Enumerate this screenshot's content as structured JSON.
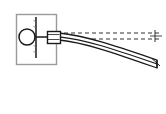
{
  "figure": {
    "canvas": {
      "width": 166,
      "height": 114,
      "background": "#ffffff"
    },
    "colors": {
      "outline": "#1a1a1a",
      "box_border": "#9a9a9a",
      "dashed_line": "#333333",
      "beam_fill": "#ffffff",
      "hub_fill": "#ffffff",
      "background": "#ffffff"
    },
    "elements": {
      "support_box": {
        "label": "support-housing",
        "x": 16,
        "y": 14,
        "width": 40,
        "height": 50,
        "stroke": "#9a9a9a",
        "fill": "#ffffff"
      },
      "hub_circle": {
        "label": "pivot-hub",
        "cx": 27,
        "cy": 37,
        "r": 8,
        "stroke": "#1a1a1a",
        "fill": "#ffffff"
      },
      "wall_line": {
        "label": "fixed-wall",
        "x": 36,
        "y1": 17,
        "y2": 58,
        "stroke": "#1a1a1a"
      },
      "shaft_line": {
        "label": "shaft-axis",
        "x1": 19,
        "x2": 48,
        "y": 37,
        "stroke": "#1a1a1a"
      },
      "clamp_block": {
        "label": "beam-clamp",
        "x": 47,
        "y": 31,
        "width": 13,
        "height": 12,
        "stroke": "#1a1a1a",
        "fill": "#ffffff"
      },
      "reference_lines": {
        "label": "undeflected-axis-reference",
        "count": 2,
        "y_values": [
          33,
          39
        ],
        "x_start": 57,
        "x_end": 160,
        "style": "dashed",
        "dash_pattern": "4 3",
        "stroke": "#333333"
      },
      "end_tick": {
        "label": "reference-end-tick",
        "x": 155,
        "y1": 30,
        "y2": 42,
        "stroke": "#333333"
      },
      "beam": {
        "label": "deflected-cantilever-beam",
        "root_x": 59,
        "root_y_top": 33,
        "root_y_bottom": 40,
        "tip_x": 157,
        "tip_y_top": 60,
        "tip_y_bottom": 68,
        "curvature": "downward",
        "stroke": "#1a1a1a",
        "fill": "#ffffff",
        "edges": 3
      }
    }
  },
  "chart_data": {
    "type": "line",
    "xlabel": "",
    "ylabel": "",
    "grid": false,
    "legend_position": "none",
    "xlim": [
      0,
      166
    ],
    "ylim": [
      0,
      114
    ],
    "series": [
      {
        "name": "reference-axis-upper",
        "style": "dashed",
        "x": [
          57,
          80,
          105,
          130,
          160
        ],
        "y": [
          33,
          33,
          33,
          33,
          33
        ]
      },
      {
        "name": "reference-axis-lower",
        "style": "dashed",
        "x": [
          57,
          80,
          105,
          130,
          160
        ],
        "y": [
          39,
          39,
          39,
          39,
          39
        ]
      },
      {
        "name": "beam-top-edge",
        "style": "solid",
        "x": [
          59,
          80,
          100,
          120,
          140,
          157
        ],
        "y": [
          33,
          37,
          43,
          50,
          56,
          60
        ]
      },
      {
        "name": "beam-mid-edge",
        "style": "solid",
        "x": [
          59,
          80,
          100,
          120,
          140,
          157
        ],
        "y": [
          37,
          41,
          47,
          54,
          60,
          64
        ]
      },
      {
        "name": "beam-bottom-edge",
        "style": "solid",
        "x": [
          59,
          80,
          100,
          120,
          140,
          157
        ],
        "y": [
          40,
          45,
          51,
          58,
          64,
          68
        ]
      }
    ],
    "annotations": [
      {
        "text": "",
        "name": "pivot-hub",
        "x": 27,
        "y": 37
      },
      {
        "text": "",
        "name": "fixed-wall",
        "x": 36,
        "y": 37
      },
      {
        "text": "",
        "name": "beam-clamp",
        "x": 53,
        "y": 37
      },
      {
        "text": "",
        "name": "beam-tip",
        "x": 157,
        "y": 64
      }
    ]
  }
}
